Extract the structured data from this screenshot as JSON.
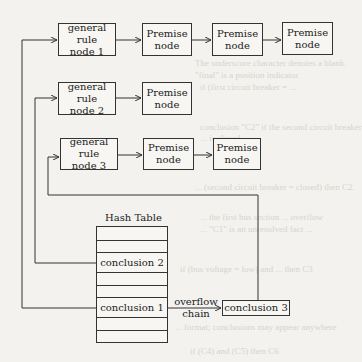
{
  "diagram": {
    "rows": [
      {
        "rule": {
          "line1": "general rule",
          "line2": "node  1"
        },
        "premises": [
          {
            "line1": "Premise",
            "line2": "node"
          },
          {
            "line1": "Premise",
            "line2": "node"
          },
          {
            "line1": "Premise",
            "line2": "node"
          }
        ]
      },
      {
        "rule": {
          "line1": "general rule",
          "line2": "node  2"
        },
        "premises": [
          {
            "line1": "Premise",
            "line2": "node"
          }
        ]
      },
      {
        "rule": {
          "line1": "general rule",
          "line2": "node  3"
        },
        "premises": [
          {
            "line1": "Premise",
            "line2": "node"
          },
          {
            "line1": "Premise",
            "line2": "node"
          }
        ]
      }
    ],
    "hash_table": {
      "title": "Hash Table",
      "entries": [
        "conclusion 2",
        "conclusion 1"
      ]
    },
    "overflow": {
      "line1": "overflow",
      "line2": "chain",
      "target": "conclusion 3"
    }
  },
  "background_ghost_text": [
    "The underscore character denotes a blank.",
    "\"final\" is a position indicator",
    "if (first circuit breaker = ...",
    "conclusion \"C2\" if the second circuit breaker",
    "... is closed",
    "... (second circuit breaker = closed) then C2.",
    "... the first bus section ... overflow",
    "... \"C1\" is an unresolved fact ...",
    "if (bus voltage = low) and ... then C3",
    "... format; conclusions may appear anywhere",
    "if (C4) and (C5) then C6"
  ]
}
